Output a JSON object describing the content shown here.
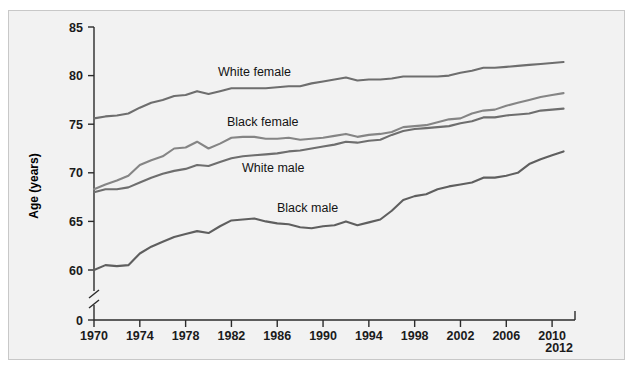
{
  "figure": {
    "background_color": "#f2f2f2",
    "border_color": "#c8c8c8",
    "page_color": "#ffffff"
  },
  "axes": {
    "y_axis_title": "Age (years)",
    "y_ticks": [
      "0",
      "60",
      "65",
      "70",
      "75",
      "80",
      "85"
    ],
    "y_axis_break": true,
    "x_ticks": [
      "1970",
      "1974",
      "1978",
      "1982",
      "1986",
      "1990",
      "1994",
      "1998",
      "2002",
      "2006",
      "2010"
    ],
    "x_end_label": "2012"
  },
  "series_labels": [
    {
      "name": "white-female",
      "text": "White female"
    },
    {
      "name": "black-female",
      "text": "Black female"
    },
    {
      "name": "white-male",
      "text": "White male"
    },
    {
      "name": "black-male",
      "text": "Black male"
    }
  ],
  "chart_data": {
    "type": "line",
    "title": "",
    "xlabel": "",
    "ylabel": "Age (years)",
    "xlim": [
      1970,
      2012
    ],
    "ylim": [
      58.5,
      85
    ],
    "y_ticks": [
      60,
      65,
      70,
      75,
      80,
      85
    ],
    "y_axis_has_break_to_zero": true,
    "x_ticks": [
      1970,
      1974,
      1978,
      1982,
      1986,
      1990,
      1994,
      1998,
      2002,
      2006,
      2010,
      2012
    ],
    "grid": false,
    "legend": "inline-labels",
    "x": [
      1970,
      1971,
      1972,
      1973,
      1974,
      1975,
      1976,
      1977,
      1978,
      1979,
      1980,
      1981,
      1982,
      1983,
      1984,
      1985,
      1986,
      1987,
      1988,
      1989,
      1990,
      1991,
      1992,
      1993,
      1994,
      1995,
      1996,
      1997,
      1998,
      1999,
      2000,
      2001,
      2002,
      2003,
      2004,
      2005,
      2006,
      2007,
      2008,
      2009,
      2010,
      2011
    ],
    "series": [
      {
        "name": "White female",
        "color": "#6e6e6e",
        "values": [
          75.6,
          75.8,
          75.9,
          76.1,
          76.7,
          77.2,
          77.5,
          77.9,
          78.0,
          78.4,
          78.1,
          78.4,
          78.7,
          78.7,
          78.7,
          78.7,
          78.8,
          78.9,
          78.9,
          79.2,
          79.4,
          79.6,
          79.8,
          79.5,
          79.6,
          79.6,
          79.7,
          79.9,
          79.9,
          79.9,
          79.9,
          80.0,
          80.3,
          80.5,
          80.8,
          80.8,
          80.9,
          81.0,
          81.1,
          81.2,
          81.3,
          81.4
        ]
      },
      {
        "name": "Black female",
        "color": "#858585",
        "values": [
          68.3,
          68.8,
          69.2,
          69.7,
          70.8,
          71.3,
          71.7,
          72.5,
          72.6,
          73.2,
          72.5,
          73.0,
          73.6,
          73.7,
          73.7,
          73.5,
          73.5,
          73.6,
          73.4,
          73.5,
          73.6,
          73.8,
          74.0,
          73.7,
          73.9,
          74.0,
          74.2,
          74.7,
          74.8,
          74.9,
          75.2,
          75.5,
          75.6,
          76.1,
          76.4,
          76.5,
          76.9,
          77.2,
          77.5,
          77.8,
          78.0,
          78.2
        ]
      },
      {
        "name": "White male",
        "color": "#6e6e6e",
        "values": [
          68.0,
          68.3,
          68.3,
          68.5,
          69.0,
          69.5,
          69.9,
          70.2,
          70.4,
          70.8,
          70.7,
          71.1,
          71.5,
          71.7,
          71.8,
          71.9,
          72.0,
          72.2,
          72.3,
          72.5,
          72.7,
          72.9,
          73.2,
          73.1,
          73.3,
          73.4,
          73.9,
          74.3,
          74.5,
          74.6,
          74.7,
          74.8,
          75.1,
          75.3,
          75.7,
          75.7,
          75.9,
          76.0,
          76.1,
          76.4,
          76.5,
          76.6
        ]
      },
      {
        "name": "Black male",
        "color": "#5f5f5f",
        "values": [
          60.0,
          60.5,
          60.4,
          60.5,
          61.7,
          62.4,
          62.9,
          63.4,
          63.7,
          64.0,
          63.8,
          64.5,
          65.1,
          65.2,
          65.3,
          65.0,
          64.8,
          64.7,
          64.4,
          64.3,
          64.5,
          64.6,
          65.0,
          64.6,
          64.9,
          65.2,
          66.1,
          67.2,
          67.6,
          67.8,
          68.3,
          68.6,
          68.8,
          69.0,
          69.5,
          69.5,
          69.7,
          70.0,
          70.9,
          71.4,
          71.8,
          72.2
        ]
      }
    ]
  }
}
